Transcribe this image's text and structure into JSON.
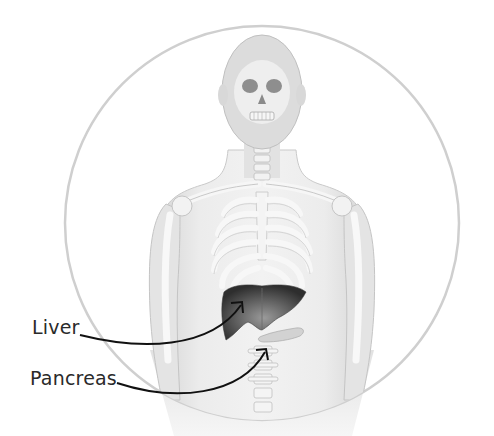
{
  "diagram": {
    "labels": [
      {
        "id": "liver",
        "text": "Liver",
        "target": "liver"
      },
      {
        "id": "pancreas",
        "text": "Pancreas",
        "target": "pancreas"
      }
    ],
    "colors": {
      "background": "#ffffff",
      "circle_outline": "#c8c8c8",
      "body": "#e6e6e6",
      "bone": "#f4f4f4",
      "bone_shadow": "#bdbdbd",
      "liver_dark": "#3a3a3a",
      "liver_light": "#8a8a8a",
      "pancreas": "#d0d0d0",
      "arrow": "#111111",
      "label_text": "#2a2a2a"
    }
  }
}
